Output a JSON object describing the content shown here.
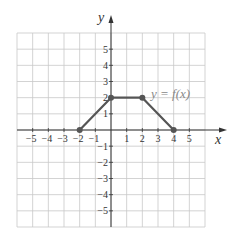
{
  "chart_data": {
    "type": "line",
    "title": "",
    "xlabel": "x",
    "ylabel": "y",
    "xlim": [
      -6,
      6
    ],
    "ylim": [
      -6,
      6
    ],
    "grid": true,
    "x_ticks": [
      -5,
      -4,
      -3,
      -2,
      -1,
      1,
      2,
      3,
      4,
      5
    ],
    "y_ticks": [
      5,
      4,
      3,
      2,
      1,
      -1,
      -2,
      -3,
      -4,
      -5
    ],
    "series": [
      {
        "name": "y = f(x)",
        "points": [
          [
            -2,
            0
          ],
          [
            0,
            2
          ],
          [
            2,
            2
          ],
          [
            4,
            0
          ]
        ],
        "markers": true
      }
    ],
    "annotations": [
      {
        "text": "y = f(x)",
        "x": 2.7,
        "y": 2.5
      }
    ]
  },
  "colors": {
    "grid": "#c8c8c8",
    "axis": "#333333",
    "line": "#555555",
    "label": "#333333",
    "annotation": "#888888"
  },
  "labels": {
    "x_axis": "x",
    "y_axis": "y",
    "function_label": "y = f(x)"
  }
}
